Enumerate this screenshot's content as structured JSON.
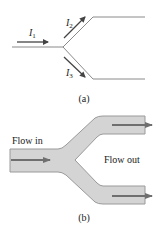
{
  "diagram_a": {
    "caption": "(a)",
    "currents": [
      {
        "symbol": "I",
        "subscript": "1"
      },
      {
        "symbol": "I",
        "subscript": "2"
      },
      {
        "symbol": "I",
        "subscript": "3"
      }
    ],
    "colors": {
      "wire": "#8a8a8a",
      "arrow": "#444444"
    }
  },
  "diagram_b": {
    "caption": "(b)",
    "flow_in_label": "Flow in",
    "flow_out_label": "Flow out",
    "colors": {
      "pipe_fill": "#d4d4d4",
      "pipe_edge": "#9a9a9a",
      "arrow": "#6f6f6f"
    }
  }
}
